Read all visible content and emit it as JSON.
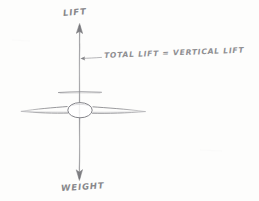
{
  "diagram": {
    "background_color": "#fdfdfc",
    "ink_color": "#7a7a7e",
    "medium": "pencil-sketch"
  },
  "labels": {
    "lift": "LIFT",
    "weight": "WEIGHT",
    "annotation": "TOTAL LIFT = VERTICAL LIFT"
  },
  "forces": [
    {
      "name": "lift",
      "label": "LIFT",
      "direction": "up",
      "arrow_tip_y": 24,
      "arrow_tail_y": 112
    },
    {
      "name": "weight",
      "label": "WEIGHT",
      "direction": "down",
      "arrow_tip_y": 180,
      "arrow_tail_y": 110
    }
  ],
  "aircraft": {
    "name": "aircraft-front-view",
    "fuselage_shape": "ellipse",
    "fuselage_center_x": 80,
    "fuselage_center_y": 110,
    "wing_span_left_x": 20,
    "wing_span_right_x": 146,
    "tailplane_y": 92
  },
  "leader_line": {
    "name": "annotation-leader",
    "from_x": 100,
    "to_x": 80,
    "y": 58,
    "has_arrowhead": true
  }
}
